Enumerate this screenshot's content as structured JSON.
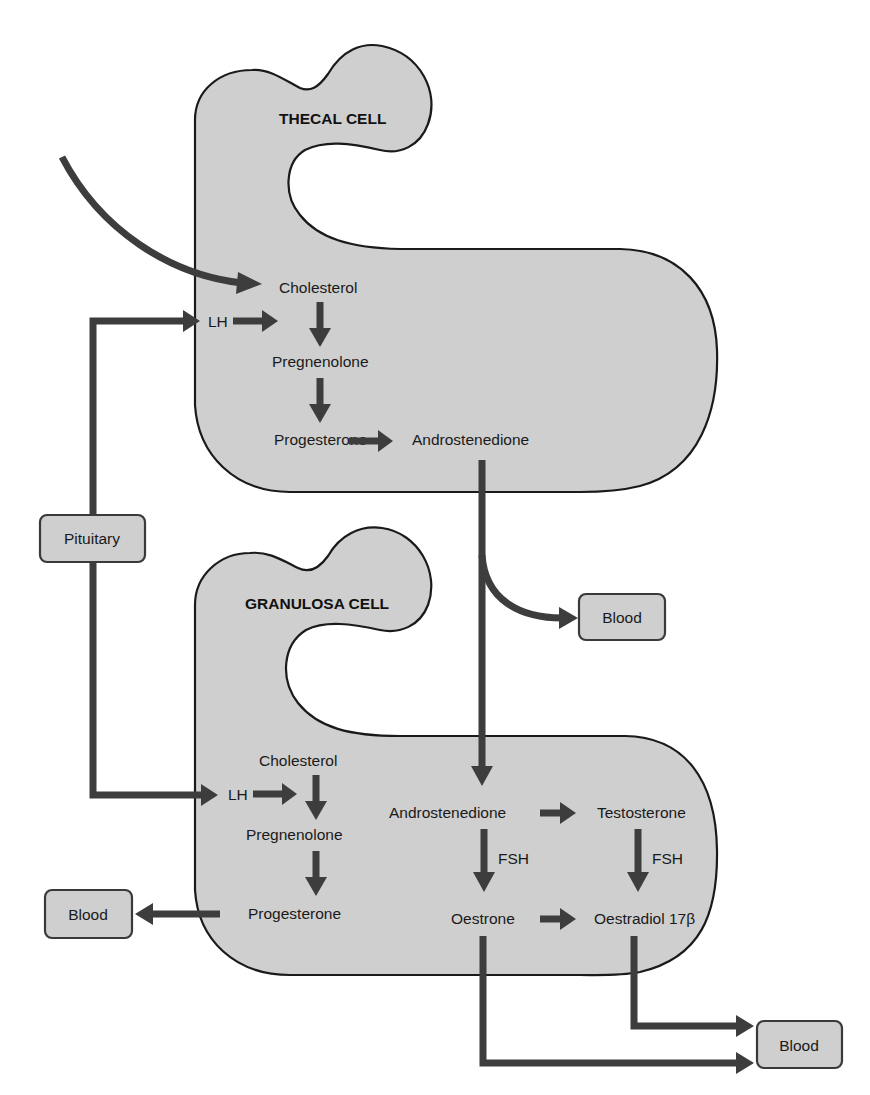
{
  "diagram": {
    "colors": {
      "cell_fill": "#cfcfcf",
      "outline": "#1a1a1a",
      "arrow": "#3d3d3d",
      "background": "#ffffff"
    },
    "thecal_cell": {
      "title": "THECAL CELL",
      "nodes": {
        "cholesterol": "Cholesterol",
        "lh": "LH",
        "pregnenolone": "Pregnenolone",
        "progesterone": "Progesterone",
        "androstenedione": "Androstenedione"
      }
    },
    "granulosa_cell": {
      "title": "GRANULOSA CELL",
      "nodes": {
        "cholesterol": "Cholesterol",
        "lh": "LH",
        "pregnenolone": "Pregnenolone",
        "progesterone": "Progesterone",
        "androstenedione": "Androstenedione",
        "testosterone": "Testosterone",
        "fsh_left": "FSH",
        "fsh_right": "FSH",
        "oestrone": "Oestrone",
        "oestradiol": "Oestradiol 17β"
      }
    },
    "external": {
      "pituitary": "Pituitary",
      "blood_thecal": "Blood",
      "blood_granulosa_left": "Blood",
      "blood_bottom_right": "Blood"
    },
    "edges": [
      {
        "from": "external",
        "to": "thecal.cholesterol"
      },
      {
        "from": "pituitary",
        "to": "thecal.lh"
      },
      {
        "from": "pituitary",
        "to": "granulosa.lh"
      },
      {
        "from": "thecal.lh",
        "to": "thecal.cholesterol->pregnenolone"
      },
      {
        "from": "thecal.cholesterol",
        "to": "thecal.pregnenolone"
      },
      {
        "from": "thecal.pregnenolone",
        "to": "thecal.progesterone"
      },
      {
        "from": "thecal.progesterone",
        "to": "thecal.androstenedione"
      },
      {
        "from": "thecal.androstenedione",
        "to": "blood_thecal"
      },
      {
        "from": "thecal.androstenedione",
        "to": "granulosa.androstenedione"
      },
      {
        "from": "granulosa.lh",
        "to": "granulosa.cholesterol->pregnenolone"
      },
      {
        "from": "granulosa.cholesterol",
        "to": "granulosa.pregnenolone"
      },
      {
        "from": "granulosa.pregnenolone",
        "to": "granulosa.progesterone"
      },
      {
        "from": "granulosa.progesterone",
        "to": "blood_granulosa_left"
      },
      {
        "from": "granulosa.androstenedione",
        "to": "granulosa.testosterone"
      },
      {
        "from": "granulosa.androstenedione",
        "to": "granulosa.oestrone",
        "label": "FSH"
      },
      {
        "from": "granulosa.testosterone",
        "to": "granulosa.oestradiol",
        "label": "FSH"
      },
      {
        "from": "granulosa.oestrone",
        "to": "granulosa.oestradiol"
      },
      {
        "from": "granulosa.oestradiol",
        "to": "blood_bottom_right"
      },
      {
        "from": "granulosa.oestrone",
        "to": "blood_bottom_right"
      }
    ]
  }
}
